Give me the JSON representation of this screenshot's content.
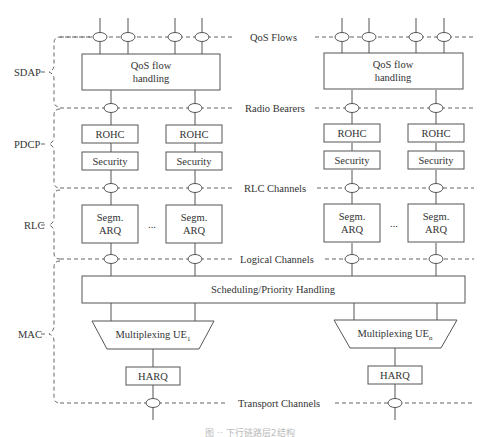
{
  "diagram": {
    "layers": {
      "sdap": "SDAP",
      "pdcp": "PDCP",
      "rlc": "RLC",
      "mac": "MAC"
    },
    "channels": {
      "qos_flows": "QoS Flows",
      "radio_bearers": "Radio Bearers",
      "rlc_channels": "RLC Channels",
      "logical_channels": "Logical Channels",
      "transport_channels": "Transport Channels"
    },
    "blocks": {
      "qos_flow_handling_line1": "QoS flow",
      "qos_flow_handling_line2": "handling",
      "rohc": "ROHC",
      "security": "Security",
      "segm_line1": "Segm.",
      "segm_line2": "ARQ",
      "ellipsis": "...",
      "scheduling": "Scheduling/Priority Handling",
      "multiplexing_prefix": "Multiplexing UE",
      "multiplexing_left_sub": "1",
      "multiplexing_right_sub": "n",
      "harq": "HARQ"
    },
    "caption": "图 ·· 下行链路层2结构"
  }
}
